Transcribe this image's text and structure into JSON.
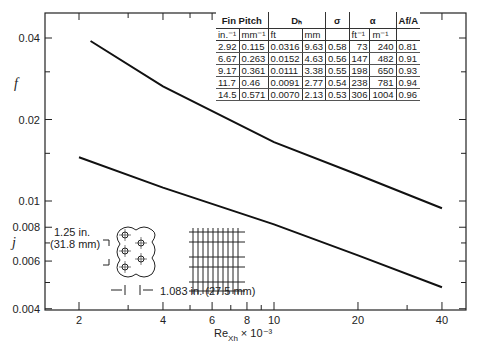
{
  "chart_data": {
    "type": "line",
    "title": "",
    "xlabel": "Re_Xh × 10^-3",
    "xscale": "log",
    "xlim": [
      1.7,
      47
    ],
    "xticks": [
      2,
      4,
      6,
      8,
      10,
      20,
      40
    ],
    "ylabels": [
      "f",
      "j"
    ],
    "yscale": "log",
    "ylim": [
      0.004,
      0.048
    ],
    "yticks": [
      0.004,
      0.006,
      0.008,
      0.01,
      0.02,
      0.04
    ],
    "series": [
      {
        "name": "f",
        "x": [
          2.2,
          4,
          10,
          20,
          40
        ],
        "values": [
          0.039,
          0.0265,
          0.0165,
          0.0125,
          0.0094
        ]
      },
      {
        "name": "j",
        "x": [
          2,
          4,
          10,
          20,
          40
        ],
        "values": [
          0.0145,
          0.0112,
          0.0082,
          0.0063,
          0.0048
        ]
      }
    ],
    "grid": false,
    "legend": null
  },
  "axis": {
    "y_ticks": [
      "0.04",
      "0.02",
      "0.01",
      "0.008",
      "0.006",
      "0.004"
    ],
    "x_ticks": [
      "2",
      "4",
      "6",
      "8",
      "10",
      "20",
      "40"
    ],
    "f_label": "f",
    "j_label": "j",
    "x_label_main": "Re",
    "x_label_sub": "Xh",
    "x_label_suffix": "× 10⁻³"
  },
  "table": {
    "headers": [
      "Fin Pitch",
      "Dₕ",
      "σ",
      "α",
      "Af/A"
    ],
    "units": [
      "in.⁻¹",
      "mm⁻¹",
      "ft",
      "mm",
      "",
      "ft⁻¹",
      "m⁻¹",
      ""
    ],
    "rows": [
      [
        "2.92",
        "0.115",
        "0.0316",
        "9.63",
        "0.58",
        "73",
        "240",
        "0.81"
      ],
      [
        "6.67",
        "0.263",
        "0.0152",
        "4.63",
        "0.56",
        "147",
        "482",
        "0.91"
      ],
      [
        "9.17",
        "0.361",
        "0.0111",
        "3.38",
        "0.55",
        "198",
        "650",
        "0.93"
      ],
      [
        "11.7",
        "0.46",
        "0.0091",
        "2.77",
        "0.54",
        "238",
        "781",
        "0.94"
      ],
      [
        "14.5",
        "0.571",
        "0.0070",
        "2.13",
        "0.53",
        "306",
        "1004",
        "0.96"
      ]
    ]
  },
  "annotations": {
    "spacing_transverse": "1.25 in.",
    "spacing_transverse_mm": "(31.8 mm)",
    "spacing_longitudinal": "1.083 in. (27.5 mm)"
  }
}
